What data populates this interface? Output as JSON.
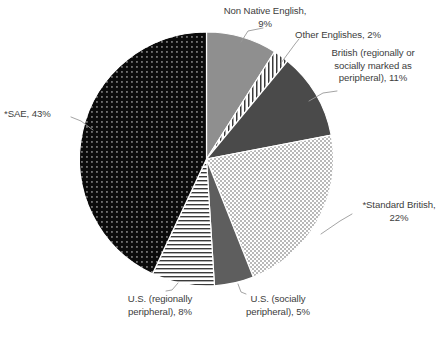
{
  "chart_data": {
    "type": "pie",
    "title": "",
    "subtitle": "",
    "legend_position": "none",
    "grid": false,
    "start_angle_deg": 0,
    "direction": "clockwise",
    "categories": [
      "Non Native English",
      "Other Englishes",
      "British (regionally or socially marked as peripheral)",
      "*Standard British",
      "U.S. (socially peripheral)",
      "U.S. (regionally peripheral)",
      "*SAE"
    ],
    "values": [
      9,
      2,
      11,
      22,
      5,
      8,
      43
    ],
    "value_unit": "%",
    "slices": [
      {
        "name": "Non Native English",
        "value": 9,
        "label": "Non Native English,\n9%",
        "fill": "solid-gray",
        "color": "#8f8f8f"
      },
      {
        "name": "Other Englishes",
        "value": 2,
        "label": "Other Englishes, 2%",
        "fill": "vertical-stripes",
        "color": "#ffffff"
      },
      {
        "name": "British (regionally or socially marked as peripheral)",
        "value": 11,
        "label": "British (regionally or\nsocially marked as\nperipheral), 11%",
        "fill": "solid-dark-gray",
        "color": "#4a4a4a"
      },
      {
        "name": "*Standard British",
        "value": 22,
        "label": "*Standard British,\n22%",
        "fill": "light-checkerboard",
        "color": "#e3e3e3"
      },
      {
        "name": "U.S. (socially peripheral)",
        "value": 5,
        "label": "U.S. (socially\nperipheral), 5%",
        "fill": "solid-mid-gray",
        "color": "#5e5e5e"
      },
      {
        "name": "U.S. (regionally peripheral)",
        "value": 8,
        "label": "U.S. (regionally\nperipheral), 8%",
        "fill": "horizontal-stripes",
        "color": "#ffffff"
      },
      {
        "name": "*SAE",
        "value": 43,
        "label": "*SAE, 43%",
        "fill": "black-dotted",
        "color": "#0b0b0b"
      }
    ],
    "xlabel": "",
    "ylabel": ""
  },
  "labels": {
    "non_native_english": "Non Native English,\n9%",
    "other_englishes": "Other Englishes, 2%",
    "british_peripheral": "British (regionally or\nsocially marked as\nperipheral), 11%",
    "standard_british": "*Standard British,\n22%",
    "us_socially_peripheral": "U.S. (socially\nperipheral), 5%",
    "us_regionally_peripheral": "U.S. (regionally\nperipheral), 8%",
    "sae": "*SAE, 43%"
  },
  "colors": {
    "text": "#3d3d3d",
    "leader_line": "#9a9a9a",
    "background": "#ffffff",
    "slice_outline": "#ffffff"
  }
}
